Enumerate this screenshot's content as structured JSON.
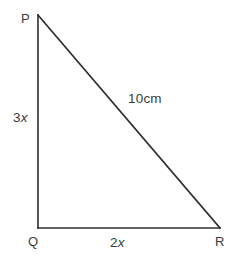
{
  "figure": {
    "background_color": "#ffffff",
    "stroke_color": "#2f2f2f",
    "text_color": "#3b3b3b",
    "stroke_width": 1.6,
    "vertices": [
      {
        "name": "P",
        "label": "P",
        "x": 38,
        "y": 15
      },
      {
        "name": "Q",
        "label": "Q",
        "x": 38,
        "y": 228
      },
      {
        "name": "R",
        "label": "R",
        "x": 220,
        "y": 228
      }
    ],
    "sides": [
      {
        "name": "PQ",
        "label_prefix": "3",
        "label_variable": "x",
        "full_label": "3x",
        "from": "P",
        "to": "Q",
        "orientation": "vertical"
      },
      {
        "name": "QR",
        "label_prefix": "2",
        "label_variable": "x",
        "full_label": "2x",
        "from": "Q",
        "to": "R",
        "orientation": "horizontal"
      },
      {
        "name": "PR",
        "label_prefix": "10cm",
        "label_variable": "",
        "full_label": "10cm",
        "from": "P",
        "to": "R",
        "orientation": "hypotenuse"
      }
    ]
  }
}
